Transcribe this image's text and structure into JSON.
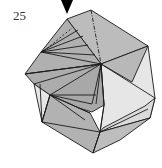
{
  "diagram": {
    "type": "origami-folding-step",
    "step_number": "25",
    "arrow": {
      "icon": "push-down-arrow",
      "color": "#000000"
    },
    "colors": {
      "dark_face": "#a9a9a9",
      "mid_face": "#bdbdbd",
      "light_face": "#e4e4e4",
      "line": "#1a1a1a"
    },
    "lines": {
      "valley_fold": "dashed",
      "mountain_fold": "dash-dot"
    }
  }
}
